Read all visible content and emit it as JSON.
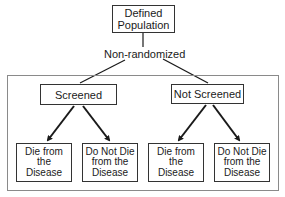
{
  "diagram": {
    "root": {
      "label": "Defined Population"
    },
    "split_label": "Non-randomized",
    "groups": [
      {
        "label": "Screened",
        "outcomes": [
          {
            "label": "Die from the Disease"
          },
          {
            "label": "Do Not Die from the Disease"
          }
        ]
      },
      {
        "label": "Not Screened",
        "outcomes": [
          {
            "label": "Die from the Disease"
          },
          {
            "label": "Do Not Die from the Disease"
          }
        ]
      }
    ],
    "colors": {
      "line": "#1a1a1a",
      "frame": "#8a8a8a",
      "box_border": "#333333"
    }
  }
}
